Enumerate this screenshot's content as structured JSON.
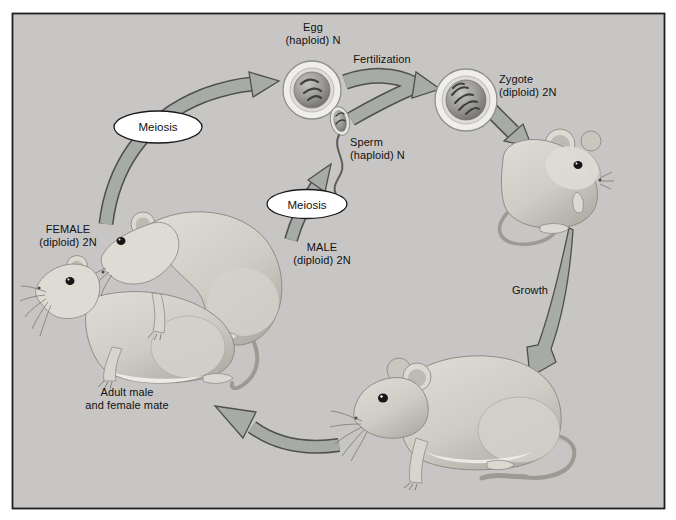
{
  "figure": {
    "type": "life-cycle-diagram",
    "labels": {
      "egg": "Egg\n(haploid) N",
      "fertilization": "Fertilization",
      "zygote": "Zygote\n(diploid) 2N",
      "sperm": "Sperm\n(haploid) N",
      "meiosis_left": "Meiosis",
      "meiosis_right": "Meiosis",
      "female": "FEMALE\n(diploid) 2N",
      "male": "MALE\n(diploid) 2N",
      "growth": "Growth",
      "mating": "Adult male\nand female mate"
    },
    "colors": {
      "background": "#c7c6c4",
      "frame": "#1f1f1f",
      "arrow_fill": "#a7aba8",
      "arrow_outline": "#4f4f4d",
      "badge_fill": "#ffffff",
      "badge_outline": "#1a1a1a",
      "text": "#111111"
    }
  }
}
